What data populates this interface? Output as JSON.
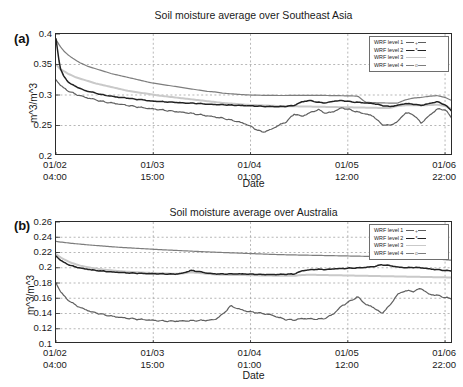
{
  "figure": {
    "background": "#ffffff",
    "panels": [
      {
        "tag": "(a)",
        "title": "Soil moisture average over Southeast Asia",
        "ylabel": "m^3/m^3",
        "xlabel": "Date"
      },
      {
        "tag": "(b)",
        "title": "Soil moisture average over Australia",
        "ylabel": "m^3/m^3",
        "xlabel": "Date"
      }
    ]
  },
  "legend": {
    "entries": [
      {
        "label": "WRF level 1",
        "color": "#5f5f5f",
        "marker": "+"
      },
      {
        "label": "WRF level 2",
        "color": "#222222",
        "marker": "*"
      },
      {
        "label": "WRF level 3",
        "color": "#c9c9c9",
        "marker": ""
      },
      {
        "label": "WRF level 4",
        "color": "#7d7d7d",
        "marker": "o"
      }
    ]
  },
  "chart_data": [
    {
      "type": "line",
      "title": "Soil moisture average over Southeast Asia",
      "panel": "(a)",
      "xlabel": "Date",
      "ylabel": "m^3/m^3",
      "ylim": [
        0.2,
        0.4
      ],
      "yticks": [
        0.2,
        0.25,
        0.3,
        0.35,
        0.4
      ],
      "ytick_labels": [
        "0.2",
        "0.25",
        "0.3",
        "0.35",
        "0.4"
      ],
      "xlim": [
        0,
        100
      ],
      "xticks": [
        0,
        24.5,
        49,
        73.5,
        98
      ],
      "xtick_labels": [
        [
          "01/02",
          "04:00"
        ],
        [
          "01/03",
          "15:00"
        ],
        [
          "01/04",
          "01:00"
        ],
        [
          "01/05",
          "12:00"
        ],
        [
          "01/06",
          "22:00"
        ]
      ],
      "grid": true,
      "legend_position": "top-right",
      "series": [
        {
          "name": "WRF level 1",
          "color": "#5f5f5f",
          "x": [
            0,
            1,
            2,
            3,
            4,
            5,
            6,
            7,
            8,
            9,
            10,
            12,
            14,
            16,
            18,
            20,
            22,
            24,
            26,
            28,
            30,
            32,
            34,
            36,
            38,
            40,
            42,
            44,
            46,
            48,
            50,
            52,
            54,
            56,
            58,
            60,
            62,
            64,
            66,
            68,
            70,
            72,
            74,
            76,
            78,
            80,
            82,
            84,
            86,
            88,
            90,
            92,
            94,
            96,
            98,
            100
          ],
          "values": [
            0.325,
            0.317,
            0.311,
            0.307,
            0.304,
            0.301,
            0.299,
            0.297,
            0.295,
            0.294,
            0.292,
            0.289,
            0.287,
            0.285,
            0.283,
            0.281,
            0.279,
            0.2775,
            0.276,
            0.2745,
            0.273,
            0.2715,
            0.27,
            0.268,
            0.266,
            0.264,
            0.262,
            0.259,
            0.256,
            0.252,
            0.245,
            0.239,
            0.243,
            0.25,
            0.256,
            0.269,
            0.265,
            0.271,
            0.276,
            0.27,
            0.273,
            0.279,
            0.276,
            0.272,
            0.269,
            0.265,
            0.252,
            0.25,
            0.256,
            0.271,
            0.268,
            0.254,
            0.266,
            0.277,
            0.276,
            0.26
          ]
        },
        {
          "name": "WRF level 2",
          "color": "#222222",
          "x": [
            0,
            1,
            2,
            3,
            4,
            5,
            6,
            7,
            8,
            9,
            10,
            12,
            14,
            16,
            18,
            20,
            22,
            24,
            26,
            28,
            30,
            32,
            34,
            36,
            38,
            40,
            42,
            44,
            46,
            48,
            50,
            52,
            54,
            56,
            58,
            60,
            62,
            64,
            66,
            68,
            70,
            72,
            74,
            76,
            78,
            80,
            82,
            84,
            86,
            88,
            90,
            92,
            94,
            96,
            98,
            100
          ],
          "values": [
            0.392,
            0.345,
            0.33,
            0.322,
            0.317,
            0.314,
            0.311,
            0.308,
            0.306,
            0.305,
            0.303,
            0.3,
            0.298,
            0.296,
            0.295,
            0.293,
            0.292,
            0.29,
            0.2895,
            0.2885,
            0.288,
            0.287,
            0.2865,
            0.286,
            0.285,
            0.2845,
            0.284,
            0.2835,
            0.283,
            0.2825,
            0.282,
            0.2815,
            0.281,
            0.2808,
            0.2815,
            0.283,
            0.289,
            0.291,
            0.288,
            0.287,
            0.29,
            0.291,
            0.289,
            0.288,
            0.287,
            0.286,
            0.283,
            0.281,
            0.283,
            0.286,
            0.285,
            0.283,
            0.286,
            0.289,
            0.284,
            0.272
          ]
        },
        {
          "name": "WRF level 3",
          "color": "#c9c9c9",
          "x": [
            0,
            1,
            2,
            3,
            4,
            5,
            6,
            7,
            8,
            9,
            10,
            12,
            14,
            16,
            18,
            20,
            22,
            24,
            26,
            28,
            30,
            32,
            34,
            36,
            38,
            40,
            42,
            44,
            46,
            48,
            50,
            52,
            54,
            56,
            58,
            60,
            62,
            64,
            66,
            68,
            70,
            72,
            74,
            76,
            78,
            80,
            82,
            84,
            86,
            88,
            90,
            92,
            94,
            96,
            98,
            100
          ],
          "values": [
            0.35,
            0.343,
            0.339,
            0.335,
            0.332,
            0.329,
            0.327,
            0.325,
            0.323,
            0.321,
            0.319,
            0.316,
            0.313,
            0.31,
            0.307,
            0.305,
            0.303,
            0.301,
            0.299,
            0.2975,
            0.296,
            0.2945,
            0.293,
            0.2915,
            0.29,
            0.2885,
            0.287,
            0.286,
            0.285,
            0.284,
            0.2835,
            0.283,
            0.2825,
            0.282,
            0.2818,
            0.2815,
            0.2812,
            0.281,
            0.2808,
            0.2805,
            0.2802,
            0.28,
            0.2798,
            0.2796,
            0.2793,
            0.279,
            0.2788,
            0.2786,
            0.282,
            0.283,
            0.2832,
            0.283,
            0.2835,
            0.284,
            0.282,
            0.276
          ]
        },
        {
          "name": "WRF level 4",
          "color": "#7d7d7d",
          "x": [
            0,
            1,
            2,
            3,
            4,
            5,
            6,
            7,
            8,
            9,
            10,
            12,
            14,
            16,
            18,
            20,
            22,
            24,
            26,
            28,
            30,
            32,
            34,
            36,
            38,
            40,
            42,
            44,
            46,
            48,
            50,
            52,
            54,
            56,
            58,
            60,
            62,
            64,
            66,
            68,
            70,
            72,
            74,
            76,
            78,
            80,
            82,
            84,
            86,
            88,
            90,
            92,
            94,
            96,
            98,
            100
          ],
          "values": [
            0.391,
            0.38,
            0.372,
            0.366,
            0.361,
            0.357,
            0.353,
            0.35,
            0.347,
            0.345,
            0.343,
            0.339,
            0.335,
            0.332,
            0.329,
            0.326,
            0.323,
            0.32,
            0.318,
            0.316,
            0.314,
            0.312,
            0.31,
            0.308,
            0.306,
            0.305,
            0.303,
            0.302,
            0.301,
            0.3002,
            0.2998,
            0.2995,
            0.2993,
            0.2992,
            0.2992,
            0.2993,
            0.2994,
            0.2995,
            0.2994,
            0.2992,
            0.299,
            0.2988,
            0.2985,
            0.2982,
            0.288,
            0.2875,
            0.287,
            0.2868,
            0.2866,
            0.292,
            0.295,
            0.296,
            0.298,
            0.299,
            0.296,
            0.29
          ]
        }
      ]
    },
    {
      "type": "line",
      "title": "Soil moisture average over Australia",
      "panel": "(b)",
      "xlabel": "Date",
      "ylabel": "m^3/m^3",
      "ylim": [
        0.1,
        0.26
      ],
      "yticks": [
        0.1,
        0.12,
        0.14,
        0.16,
        0.18,
        0.2,
        0.22,
        0.24,
        0.26
      ],
      "ytick_labels": [
        "0.1",
        "0.12",
        "0.14",
        "0.16",
        "0.18",
        "0.2",
        "0.22",
        "0.24",
        "0.26"
      ],
      "xlim": [
        0,
        100
      ],
      "xticks": [
        0,
        24.5,
        49,
        73.5,
        98
      ],
      "xtick_labels": [
        [
          "01/02",
          "04:00"
        ],
        [
          "01/03",
          "15:00"
        ],
        [
          "01/04",
          "01:00"
        ],
        [
          "01/05",
          "12:00"
        ],
        [
          "01/06",
          "22:00"
        ]
      ],
      "grid": true,
      "legend_position": "top-right",
      "series": [
        {
          "name": "WRF level 1",
          "color": "#5f5f5f",
          "x": [
            0,
            1,
            2,
            3,
            4,
            5,
            6,
            7,
            8,
            9,
            10,
            12,
            14,
            16,
            18,
            20,
            22,
            24,
            26,
            28,
            30,
            32,
            34,
            36,
            38,
            40,
            42,
            44,
            46,
            48,
            50,
            52,
            54,
            56,
            58,
            60,
            62,
            64,
            66,
            68,
            70,
            72,
            74,
            76,
            78,
            80,
            82,
            84,
            86,
            88,
            90,
            92,
            94,
            96,
            98,
            100
          ],
          "values": [
            0.18,
            0.17,
            0.163,
            0.158,
            0.154,
            0.151,
            0.148,
            0.146,
            0.144,
            0.142,
            0.141,
            0.1385,
            0.1365,
            0.135,
            0.1338,
            0.1328,
            0.132,
            0.1312,
            0.1305,
            0.13,
            0.13,
            0.1302,
            0.1305,
            0.1308,
            0.131,
            0.132,
            0.139,
            0.15,
            0.146,
            0.143,
            0.1415,
            0.14,
            0.1385,
            0.135,
            0.132,
            0.1315,
            0.1335,
            0.133,
            0.1325,
            0.134,
            0.14,
            0.15,
            0.156,
            0.162,
            0.152,
            0.148,
            0.14,
            0.15,
            0.165,
            0.17,
            0.169,
            0.173,
            0.165,
            0.164,
            0.161,
            0.159
          ]
        },
        {
          "name": "WRF level 2",
          "color": "#222222",
          "x": [
            0,
            1,
            2,
            3,
            4,
            5,
            6,
            7,
            8,
            9,
            10,
            12,
            14,
            16,
            18,
            20,
            22,
            24,
            26,
            28,
            30,
            32,
            34,
            36,
            38,
            40,
            42,
            44,
            46,
            48,
            50,
            52,
            54,
            56,
            58,
            60,
            62,
            64,
            66,
            68,
            70,
            72,
            74,
            76,
            78,
            80,
            82,
            84,
            86,
            88,
            90,
            92,
            94,
            96,
            98,
            100
          ],
          "values": [
            0.2155,
            0.2105,
            0.207,
            0.2045,
            0.2025,
            0.201,
            0.1998,
            0.1988,
            0.198,
            0.1972,
            0.1965,
            0.1955,
            0.1945,
            0.1938,
            0.1932,
            0.1928,
            0.1925,
            0.1922,
            0.192,
            0.1918,
            0.1916,
            0.193,
            0.1965,
            0.195,
            0.193,
            0.192,
            0.1918,
            0.1918,
            0.192,
            0.1918,
            0.1915,
            0.1912,
            0.191,
            0.1912,
            0.1915,
            0.1918,
            0.196,
            0.1975,
            0.198,
            0.1978,
            0.1985,
            0.199,
            0.1995,
            0.1998,
            0.2005,
            0.2015,
            0.204,
            0.203,
            0.201,
            0.2,
            0.2005,
            0.2,
            0.1985,
            0.1975,
            0.1965,
            0.1958
          ]
        },
        {
          "name": "WRF level 3",
          "color": "#c9c9c9",
          "x": [
            0,
            1,
            2,
            3,
            4,
            5,
            6,
            7,
            8,
            9,
            10,
            12,
            14,
            16,
            18,
            20,
            22,
            24,
            26,
            28,
            30,
            32,
            34,
            36,
            38,
            40,
            42,
            44,
            46,
            48,
            50,
            52,
            54,
            56,
            58,
            60,
            62,
            64,
            66,
            68,
            70,
            72,
            74,
            76,
            78,
            80,
            82,
            84,
            86,
            88,
            90,
            92,
            94,
            96,
            98,
            100
          ],
          "values": [
            0.218,
            0.214,
            0.211,
            0.2085,
            0.2062,
            0.2045,
            0.203,
            0.2018,
            0.2008,
            0.1998,
            0.199,
            0.1976,
            0.1965,
            0.1955,
            0.1948,
            0.1942,
            0.1936,
            0.1932,
            0.1928,
            0.1924,
            0.192,
            0.1925,
            0.194,
            0.1932,
            0.192,
            0.1912,
            0.1908,
            0.1906,
            0.1905,
            0.1903,
            0.1901,
            0.1899,
            0.1897,
            0.1896,
            0.1895,
            0.1894,
            0.1905,
            0.1908,
            0.1906,
            0.1904,
            0.1902,
            0.19,
            0.1898,
            0.1896,
            0.1894,
            0.1892,
            0.189,
            0.1888,
            0.1886,
            0.1884,
            0.1882,
            0.188,
            0.1878,
            0.1876,
            0.1874,
            0.1872
          ]
        },
        {
          "name": "WRF level 4",
          "color": "#7d7d7d",
          "x": [
            0,
            1,
            2,
            3,
            4,
            5,
            6,
            7,
            8,
            9,
            10,
            12,
            14,
            16,
            18,
            20,
            22,
            24,
            26,
            28,
            30,
            32,
            34,
            36,
            38,
            40,
            42,
            44,
            46,
            48,
            50,
            52,
            54,
            56,
            58,
            60,
            62,
            64,
            66,
            68,
            70,
            72,
            74,
            76,
            78,
            80,
            82,
            84,
            86,
            88,
            90,
            92,
            94,
            96,
            98,
            100
          ],
          "values": [
            0.2345,
            0.2338,
            0.2332,
            0.2326,
            0.232,
            0.2315,
            0.231,
            0.2305,
            0.23,
            0.2296,
            0.2292,
            0.2284,
            0.2276,
            0.2268,
            0.2262,
            0.2256,
            0.225,
            0.2244,
            0.2238,
            0.2233,
            0.2228,
            0.2223,
            0.2218,
            0.2213,
            0.2208,
            0.2204,
            0.22,
            0.2196,
            0.2192,
            0.2188,
            0.2184,
            0.218,
            0.2176,
            0.2173,
            0.217,
            0.2168,
            0.2166,
            0.2164,
            0.2162,
            0.216,
            0.2158,
            0.2156,
            0.2154,
            0.2152,
            0.215,
            0.2148,
            0.2146,
            0.2144,
            0.214,
            0.2136,
            0.213,
            0.2124,
            0.2118,
            0.2112,
            0.2106,
            0.2098
          ]
        }
      ]
    }
  ]
}
